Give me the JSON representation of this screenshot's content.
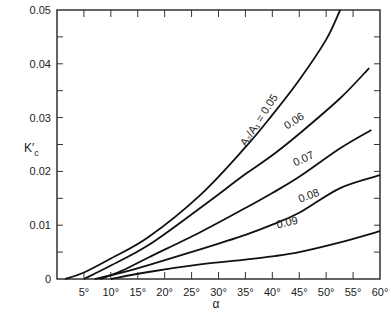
{
  "chart_data": {
    "type": "line",
    "title": "",
    "xlabel": "α",
    "ylabel": "K′c",
    "xlim": [
      0,
      60
    ],
    "ylim": [
      0,
      0.05
    ],
    "grid": false,
    "legend": "inline curve labels",
    "x_ticks": [
      "5°",
      "10°",
      "15°",
      "20°",
      "25°",
      "30°",
      "35°",
      "40°",
      "45°",
      "50°",
      "55°",
      "60°"
    ],
    "x_tick_values": [
      5,
      10,
      15,
      20,
      25,
      30,
      35,
      40,
      45,
      50,
      55,
      60
    ],
    "y_ticks": [
      "0",
      "0.01",
      "0.02",
      "0.03",
      "0.04",
      "0.05"
    ],
    "y_tick_values": [
      0,
      0.01,
      0.02,
      0.03,
      0.04,
      0.05
    ],
    "series": [
      {
        "name": "A2/A1 = 0.05",
        "label": "A₂/A₁ = 0.05",
        "x": [
          1.5,
          5,
          10,
          17,
          26.6,
          35,
          40,
          45,
          50,
          52.6
        ],
        "y": [
          0,
          0.0012,
          0.0038,
          0.0078,
          0.0156,
          0.0245,
          0.0305,
          0.037,
          0.0445,
          0.05
        ]
      },
      {
        "name": "0.06",
        "label": "0.06",
        "x": [
          5,
          10,
          17,
          26.6,
          35,
          40,
          45,
          52.6,
          58
        ],
        "y": [
          0,
          0.0025,
          0.0063,
          0.0132,
          0.0195,
          0.023,
          0.027,
          0.0336,
          0.0392
        ]
      },
      {
        "name": "0.07",
        "label": "0.07",
        "x": [
          8,
          12,
          17,
          26.6,
          35,
          40,
          45,
          52.6,
          58.4
        ],
        "y": [
          0,
          0.0015,
          0.004,
          0.0087,
          0.0132,
          0.016,
          0.019,
          0.0243,
          0.0277
        ]
      },
      {
        "name": "0.08",
        "label": "0.08",
        "x": [
          7,
          12,
          17,
          26.6,
          35,
          40,
          45,
          52.6,
          60
        ],
        "y": [
          0,
          0.0012,
          0.0026,
          0.0055,
          0.0082,
          0.0101,
          0.0123,
          0.0169,
          0.0193
        ]
      },
      {
        "name": "0.09",
        "label": "0.09",
        "x": [
          10,
          17,
          26.6,
          35,
          40,
          45,
          52.6,
          60
        ],
        "y": [
          0,
          0.0013,
          0.0027,
          0.0036,
          0.0042,
          0.005,
          0.0068,
          0.0089
        ]
      }
    ]
  }
}
